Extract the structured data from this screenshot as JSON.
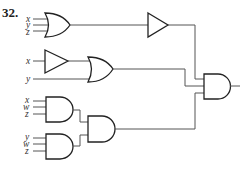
{
  "problem": {
    "number": "32."
  },
  "gates": {
    "or_top": {
      "type": "OR",
      "inputs": [
        "x",
        "y",
        "z"
      ]
    },
    "buffer_top": {
      "type": "BUFFER"
    },
    "buffer_mid": {
      "type": "BUFFER",
      "inputs": [
        "x"
      ]
    },
    "or_mid": {
      "type": "OR",
      "inputs": [
        "buffer(x)",
        "y"
      ]
    },
    "and_a": {
      "type": "AND",
      "inputs": [
        "x",
        "w",
        "z"
      ]
    },
    "and_b": {
      "type": "AND",
      "inputs": [
        "y",
        "w",
        "z"
      ]
    },
    "and_c": {
      "type": "AND",
      "inputs": [
        "and_a",
        "and_b"
      ]
    },
    "and_final": {
      "type": "AND",
      "inputs": [
        "buffer_top",
        "or_mid",
        "and_c"
      ]
    }
  },
  "labels": {
    "g1": [
      "x",
      "y",
      "z"
    ],
    "g2": [
      "x",
      "y"
    ],
    "g3": [
      "x",
      "w",
      "z"
    ],
    "g4": [
      "y",
      "w",
      "z"
    ]
  },
  "colors": {
    "line": "#222222",
    "wire": "#555555",
    "background": "#ffffff"
  }
}
